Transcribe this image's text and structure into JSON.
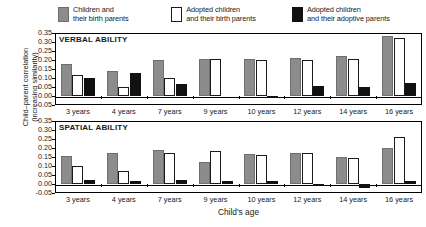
{
  "legend": {
    "items": [
      {
        "name": "children-birth-parents",
        "label": "Children and\ntheir birth parents",
        "swatch": "gray",
        "color": "#8c8c8c"
      },
      {
        "name": "adopted-birth-parents",
        "label": "Adopted children\nand their birth parents",
        "swatch": "white",
        "color": "#ffffff"
      },
      {
        "name": "adopted-adoptive-parents",
        "label": "Adopted children\nand their adoptive parents",
        "swatch": "black",
        "color": "#111111"
      }
    ]
  },
  "axes": {
    "ylabel": "Child–parent correlation\n(increasing similarity)",
    "xlabel": "Child's age",
    "yticks": [
      "0.35",
      "0.30",
      "0.25",
      "0.20",
      "0.15",
      "0.10",
      "0.05",
      "0.00",
      "-0.05"
    ],
    "categories": [
      "3 years",
      "4 years",
      "7 years",
      "9 years",
      "10 years",
      "12 years",
      "14 years",
      "16 years"
    ]
  },
  "panels": [
    {
      "key": "verbal",
      "title": "VERBAL ABILITY"
    },
    {
      "key": "spatial",
      "title": "SPATIAL ABILITY"
    }
  ],
  "chart_data": [
    {
      "type": "bar",
      "title": "VERBAL ABILITY",
      "xlabel": "Child's age",
      "ylabel": "Child–parent correlation (increasing similarity)",
      "categories": [
        "3 years",
        "4 years",
        "7 years",
        "9 years",
        "10 years",
        "12 years",
        "14 years",
        "16 years"
      ],
      "ylim": [
        -0.05,
        0.35
      ],
      "ytick_step": 0.05,
      "grid": false,
      "legend_position": "top",
      "series": [
        {
          "name": "Children and their birth parents",
          "color": "#8c8c8c",
          "values": [
            0.18,
            0.14,
            0.2,
            0.205,
            0.205,
            0.21,
            0.22,
            0.335
          ]
        },
        {
          "name": "Adopted children and their birth parents",
          "color": "#ffffff",
          "values": [
            0.115,
            0.05,
            0.1,
            0.205,
            0.2,
            0.2,
            0.205,
            0.32
          ]
        },
        {
          "name": "Adopted children and their adoptive parents",
          "color": "#111111",
          "values": [
            0.1,
            0.13,
            0.065,
            0.0,
            -0.01,
            0.055,
            0.05,
            0.075
          ]
        }
      ]
    },
    {
      "type": "bar",
      "title": "SPATIAL ABILITY",
      "xlabel": "Child's age",
      "ylabel": "Child–parent correlation (increasing similarity)",
      "categories": [
        "3 years",
        "4 years",
        "7 years",
        "9 years",
        "10 years",
        "12 years",
        "14 years",
        "16 years"
      ],
      "ylim": [
        -0.05,
        0.35
      ],
      "ytick_step": 0.05,
      "grid": false,
      "legend_position": "top",
      "series": [
        {
          "name": "Children and their birth parents",
          "color": "#8c8c8c",
          "values": [
            0.155,
            0.175,
            0.19,
            0.125,
            0.165,
            0.175,
            0.15,
            0.2
          ]
        },
        {
          "name": "Adopted children and their birth parents",
          "color": "#ffffff",
          "values": [
            0.1,
            0.075,
            0.175,
            0.185,
            0.16,
            0.175,
            0.145,
            0.26
          ]
        },
        {
          "name": "Adopted children and their adoptive parents",
          "color": "#111111",
          "values": [
            0.025,
            0.015,
            0.025,
            0.015,
            0.015,
            0.002,
            -0.022,
            0.015
          ]
        }
      ]
    }
  ]
}
